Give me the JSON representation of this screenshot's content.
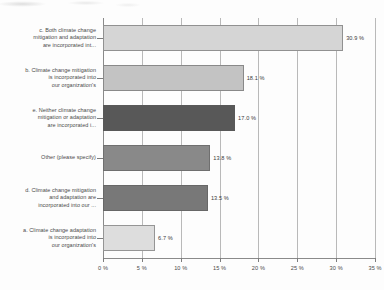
{
  "chart_data": {
    "type": "bar",
    "orientation": "horizontal",
    "title": "",
    "xlabel": "",
    "ylabel": "",
    "xlim": [
      0,
      35
    ],
    "grid": true,
    "legend": "none",
    "value_suffix": "%",
    "categories": [
      "c. Both climate change mitigation and adaptation are incorporated int...",
      "b. Climate change mitigation is incorporated into our organization's",
      "e. Neither climate change mitigation or adaptation are incorporated i...",
      "Other (please specify)",
      "d. Climate change mitigation and adaptation are incorporated into our ...",
      "a. Climate change adaptation is incorporated into our organization's"
    ],
    "category_lines": [
      [
        "c. Both climate change",
        "mitigation and adaptation",
        "are incorporated int..."
      ],
      [
        "b. Climate change mitigation",
        "is incorporated into",
        "our organization's"
      ],
      [
        "e. Neither climate change",
        "mitigation or adaptation",
        "are incorporated i..."
      ],
      [
        "Other (please specify)"
      ],
      [
        "d. Climate change mitigation",
        "and adaptation are",
        "incorporated into our ..."
      ],
      [
        "a. Climate change adaptation",
        "is incorporated into",
        "our organization's"
      ]
    ],
    "values": [
      30.9,
      18.1,
      17.0,
      13.8,
      13.5,
      6.7
    ],
    "value_labels": [
      "30.9 %",
      "18.1 %",
      "17.0 %",
      "13.8 %",
      "13.5 %",
      "6.7 %"
    ],
    "bar_colors": [
      "#d5d5d5",
      "#c3c3c3",
      "#585858",
      "#898989",
      "#787878",
      "#dddddd"
    ],
    "xticks": [
      0,
      5,
      10,
      15,
      20,
      25,
      30,
      35
    ],
    "xtick_labels": [
      "0 %",
      "5 %",
      "10 %",
      "15 %",
      "20 %",
      "25 %",
      "30 %",
      "35 %"
    ]
  }
}
